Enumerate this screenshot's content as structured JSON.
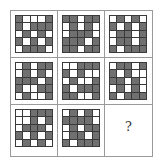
{
  "puzzle": {
    "description": "3x3 matrix of 5x5 black/white grid patterns; last cell is unknown",
    "legend": {
      "W": "white square",
      "D": "dark gray square"
    },
    "colors": {
      "dark": "#707070",
      "white": "#ffffff",
      "grid_line": "#3a3a3a",
      "border": "#9a9a9a"
    },
    "panels": [
      {
        "row": 1,
        "col": 1,
        "cells": [
          "DWWWD",
          "DWDDD",
          "WDWDW",
          "DWDWD",
          "WDDDW"
        ]
      },
      {
        "row": 1,
        "col": 2,
        "cells": [
          "DDWDD",
          "WDWDW",
          "WDDDW",
          "DDDWD",
          "DDWDD"
        ]
      },
      {
        "row": 1,
        "col": 3,
        "cells": [
          "WDWDW",
          "DWDWD",
          "WDDWD",
          "WDDWD",
          "DWDDD"
        ]
      },
      {
        "row": 2,
        "col": 1,
        "cells": [
          "WDWDD",
          "WDWDW",
          "DDDWD",
          "DWWDD",
          "WDWWD"
        ]
      },
      {
        "row": 2,
        "col": 2,
        "cells": [
          "WWDDD",
          "DWDWW",
          "WDWWD",
          "DWDDD",
          "DDWWD"
        ]
      },
      {
        "row": 2,
        "col": 3,
        "cells": [
          "WDDWD",
          "DWDWW",
          "DDWDW",
          "WDWDW",
          "DWDDD"
        ]
      },
      {
        "row": 3,
        "col": 1,
        "cells": [
          "WWDDD",
          "WWDWD",
          "WDDDW",
          "DWDWD",
          "WDWDW"
        ]
      },
      {
        "row": 3,
        "col": 2,
        "cells": [
          "WDWDW",
          "DDDDW",
          "WDWDD",
          "WDDWD",
          "DWDDD"
        ]
      }
    ],
    "missing": {
      "row": 3,
      "col": 3,
      "label": "?"
    }
  }
}
